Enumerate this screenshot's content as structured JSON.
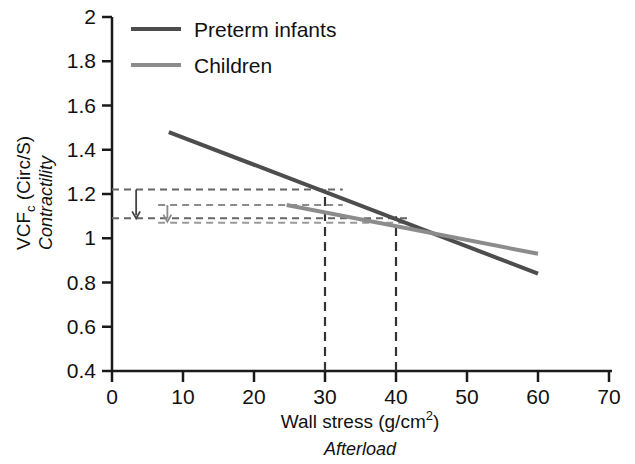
{
  "chart_data": {
    "type": "line",
    "title": "",
    "xlabel": "Wall stress (g/cm2)",
    "xlabel_main": "Wall stress (g/cm",
    "xlabel_exp": "2",
    "xlabel_close": ")",
    "xlabel_sub": "Afterload",
    "ylabel_main": "VCF",
    "ylabel_sub_c": "c",
    "ylabel_units": " (Circ/S)",
    "ylabel_sub": "Contractility",
    "xlim": [
      0,
      70
    ],
    "ylim": [
      0.4,
      2.0
    ],
    "xticks": [
      0,
      10,
      20,
      30,
      40,
      50,
      60,
      70
    ],
    "yticks": [
      0.4,
      0.6,
      0.8,
      1,
      1.2,
      1.4,
      1.6,
      1.8,
      2
    ],
    "xtick_labels": [
      "0",
      "10",
      "20",
      "30",
      "40",
      "50",
      "60",
      "70"
    ],
    "ytick_labels": [
      "0.4",
      "0.6",
      "0.8",
      "1",
      "1.2",
      "1.4",
      "1.6",
      "1.8",
      "2"
    ],
    "grid": false,
    "legend_position": "top-left",
    "series": [
      {
        "name": "Preterm infants",
        "color": "#4d4d4d",
        "x": [
          8,
          60
        ],
        "y": [
          1.48,
          0.84
        ],
        "width": 4
      },
      {
        "name": "Children",
        "color": "#8c8c8c",
        "x": [
          24.6,
          60
        ],
        "y": [
          1.15,
          0.93
        ],
        "width": 4
      }
    ],
    "annotations": {
      "h_dashes": [
        {
          "name": "preterm-at-30",
          "y": 1.22,
          "x0": 0,
          "x1": 32.5,
          "color": "#666666"
        },
        {
          "name": "children-at-30",
          "y": 1.15,
          "x0": 6.5,
          "x1": 32.5,
          "color": "#8c8c8c"
        },
        {
          "name": "crossover-level",
          "y": 1.09,
          "x0": 0,
          "x1": 42.0,
          "color": "#666666"
        },
        {
          "name": "crossover-level-light",
          "y": 1.07,
          "x0": 6.5,
          "x1": 42.0,
          "color": "#999999"
        }
      ],
      "v_dashes": [
        {
          "name": "wall-stress-30",
          "x": 30,
          "y0": 0.4,
          "y1": 1.22,
          "color": "#333333"
        },
        {
          "name": "wall-stress-40",
          "x": 40,
          "y0": 0.4,
          "y1": 1.1,
          "color": "#333333"
        }
      ],
      "arrows": [
        {
          "name": "preterm-drop-arrow",
          "x": 3.4,
          "y0": 1.22,
          "y1": 1.09,
          "color": "#444444"
        },
        {
          "name": "children-drop-arrow",
          "x": 7.8,
          "y0": 1.15,
          "y1": 1.075,
          "color": "#8a8a8a"
        }
      ]
    }
  },
  "legend": {
    "items": [
      {
        "label": "Preterm infants",
        "color": "#4d4d4d"
      },
      {
        "label": "Children",
        "color": "#8c8c8c"
      }
    ]
  }
}
